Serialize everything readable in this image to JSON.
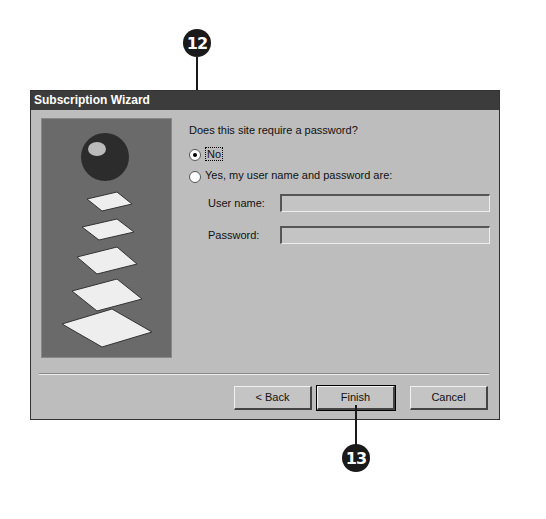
{
  "callouts": [
    {
      "label": "12"
    },
    {
      "label": "13"
    }
  ],
  "dialog": {
    "title": "Subscription Wizard",
    "question": "Does this site require a password?",
    "options": [
      {
        "label": "No",
        "selected": true
      },
      {
        "label": "Yes, my user name and password are:",
        "selected": false
      }
    ],
    "fields": [
      {
        "label": "User name:",
        "value": ""
      },
      {
        "label": "Password:",
        "value": ""
      }
    ],
    "buttons": {
      "back": "< Back",
      "finish": "Finish",
      "cancel": "Cancel"
    }
  }
}
